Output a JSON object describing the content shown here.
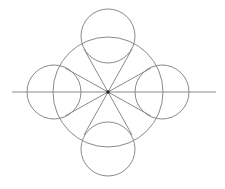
{
  "diagram": {
    "background": "#ffffff",
    "stroke_color": "#8a8a8a",
    "axis_color": "#8c8c8c",
    "center_dot_color": "#222222",
    "center": {
      "x": 108,
      "y": 92
    },
    "main_circle": {
      "cx": 108,
      "cy": 92,
      "r": 55
    },
    "axis_line": {
      "x1": 12,
      "y1": 92,
      "x2": 216,
      "y2": 92
    },
    "small_circles": [
      {
        "name": "top",
        "cx": 108,
        "cy": 36,
        "r": 27
      },
      {
        "name": "bottom",
        "cx": 108,
        "cy": 149,
        "r": 27
      },
      {
        "name": "left",
        "cx": 54,
        "cy": 92,
        "r": 27
      },
      {
        "name": "right",
        "cx": 162,
        "cy": 92,
        "r": 27
      }
    ],
    "tangent_lines": [
      {
        "x2": 84,
        "y2": 49
      },
      {
        "x2": 132,
        "y2": 49
      },
      {
        "x2": 84,
        "y2": 135
      },
      {
        "x2": 132,
        "y2": 135
      },
      {
        "x2": 65,
        "y2": 68
      },
      {
        "x2": 65,
        "y2": 116
      },
      {
        "x2": 151,
        "y2": 68
      },
      {
        "x2": 151,
        "y2": 116
      }
    ]
  }
}
